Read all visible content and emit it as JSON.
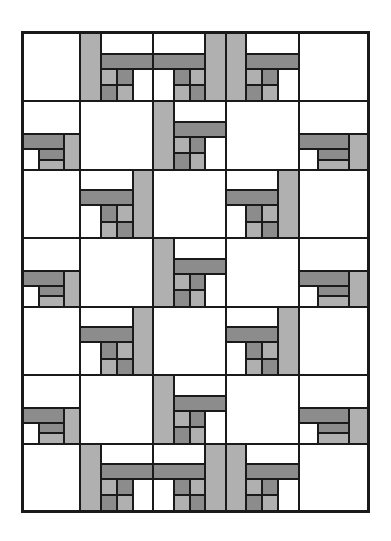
{
  "figure": {
    "kind": "quilt-pattern",
    "frame": {
      "x": 21,
      "y": 31,
      "width": 349,
      "height": 482,
      "border_color": "#1a1a1a",
      "border_width": 2
    },
    "canvas": {
      "width": 391,
      "height": 541,
      "background": "#ffffff"
    }
  },
  "palette": {
    "background": "#ffffff",
    "line": "#1a1a1a",
    "white_patch": "#ffffff",
    "light_gray_patch": "#b0b0b0",
    "dark_gray_patch": "#8c8c8c"
  },
  "grid": {
    "columns": 5,
    "rows": 7,
    "column_edges": [
      0,
      58,
      132,
      205,
      279,
      349
    ],
    "row_edges": [
      0,
      69,
      138,
      207,
      276,
      345,
      414,
      482
    ],
    "orientation_map": [
      [
        "A",
        "B",
        "C",
        "B",
        "A"
      ],
      [
        "D",
        "A",
        "B",
        "A",
        "D"
      ],
      [
        "A",
        "C",
        "A",
        "C",
        "A"
      ],
      [
        "D",
        "A",
        "B",
        "A",
        "D"
      ],
      [
        "A",
        "C",
        "A",
        "C",
        "A"
      ],
      [
        "D",
        "A",
        "B",
        "A",
        "D"
      ],
      [
        "A",
        "B",
        "C",
        "B",
        "A"
      ]
    ]
  },
  "block_library": {
    "plain": {
      "name": "plain-square-block",
      "patches": [
        {
          "shade": "white",
          "x": 0,
          "y": 0,
          "w": 100,
          "h": 100
        }
      ]
    },
    "chain_tl": {
      "name": "chain-block-top-left",
      "patches": [
        {
          "shade": "white",
          "x": 0,
          "y": 0,
          "w": 100,
          "h": 48
        },
        {
          "shade": "dark",
          "x": 0,
          "y": 48,
          "w": 72,
          "h": 22
        },
        {
          "shade": "light",
          "x": 72,
          "y": 48,
          "w": 28,
          "h": 52
        },
        {
          "shade": "white",
          "x": 0,
          "y": 70,
          "w": 28,
          "h": 30
        },
        {
          "shade": "dark",
          "x": 28,
          "y": 70,
          "w": 44,
          "h": 15
        },
        {
          "shade": "light",
          "x": 28,
          "y": 85,
          "w": 44,
          "h": 15
        }
      ]
    },
    "chain_tr": {
      "name": "chain-block-top-right",
      "patches": [
        {
          "shade": "light",
          "x": 0,
          "y": 0,
          "w": 28,
          "h": 100
        },
        {
          "shade": "white",
          "x": 28,
          "y": 0,
          "w": 72,
          "h": 30
        },
        {
          "shade": "dark",
          "x": 28,
          "y": 30,
          "w": 72,
          "h": 22
        },
        {
          "shade": "light",
          "x": 28,
          "y": 52,
          "w": 22,
          "h": 24
        },
        {
          "shade": "dark",
          "x": 50,
          "y": 52,
          "w": 22,
          "h": 24
        },
        {
          "shade": "dark",
          "x": 28,
          "y": 76,
          "w": 22,
          "h": 24
        },
        {
          "shade": "light",
          "x": 50,
          "y": 76,
          "w": 22,
          "h": 24
        },
        {
          "shade": "white",
          "x": 72,
          "y": 52,
          "w": 28,
          "h": 48
        }
      ]
    }
  },
  "legend": {
    "entries": [
      {
        "label": "Background fabric",
        "shade": "white"
      },
      {
        "label": "Medium fabric",
        "shade": "light"
      },
      {
        "label": "Dark fabric",
        "shade": "dark"
      }
    ]
  }
}
